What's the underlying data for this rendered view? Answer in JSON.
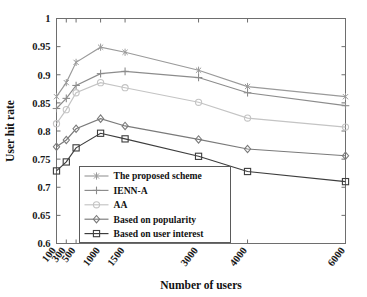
{
  "chart_data": {
    "type": "line",
    "title": "",
    "xlabel": "Number of users",
    "ylabel": "User hit rate",
    "categories": [
      "100",
      "300",
      "500",
      "1000",
      "1500",
      "3000",
      "4000",
      "6000"
    ],
    "x_positions": [
      100,
      300,
      500,
      1000,
      1500,
      3000,
      4000,
      6000
    ],
    "ylim": [
      0.6,
      1
    ],
    "yticks": [
      "0.6",
      "0.65",
      "0.7",
      "0.75",
      "0.8",
      "0.85",
      "0.9",
      "0.95",
      "1"
    ],
    "ytick_values": [
      0.6,
      0.65,
      0.7,
      0.75,
      0.8,
      0.85,
      0.9,
      0.95,
      1
    ],
    "grid": false,
    "legend_position": "lower-left-inside",
    "series": [
      {
        "name": "The proposed scheme",
        "marker": "asterisk",
        "color": "#9a9a9a",
        "values": [
          0.861,
          0.886,
          0.922,
          0.949,
          0.94,
          0.908,
          0.879,
          0.861
        ]
      },
      {
        "name": "IENN-A",
        "marker": "plus",
        "color": "#8c8c8c",
        "values": [
          0.84,
          0.858,
          0.881,
          0.902,
          0.906,
          0.895,
          0.868,
          0.845
        ]
      },
      {
        "name": "AA",
        "marker": "circle",
        "color": "#c4c4c4",
        "values": [
          0.813,
          0.838,
          0.868,
          0.886,
          0.877,
          0.851,
          0.823,
          0.807
        ]
      },
      {
        "name": "Based on popularity",
        "marker": "diamond",
        "color": "#7a7a7a",
        "values": [
          0.772,
          0.784,
          0.804,
          0.822,
          0.809,
          0.785,
          0.768,
          0.756
        ]
      },
      {
        "name": "Based on user interest",
        "marker": "square",
        "color": "#3d3d3d",
        "values": [
          0.729,
          0.745,
          0.77,
          0.796,
          0.786,
          0.755,
          0.728,
          0.71
        ]
      }
    ]
  },
  "axes": {
    "y_label": "User hit rate",
    "x_label": "Number of users",
    "y_ticks": [
      "1",
      "0.95",
      "0.9",
      "0.85",
      "0.8",
      "0.75",
      "0.7",
      "0.65",
      "0.6"
    ],
    "x_ticks": [
      "100",
      "300",
      "500",
      "1000",
      "1500",
      "3000",
      "4000",
      "6000"
    ]
  },
  "legend": {
    "items": [
      {
        "label": "The proposed scheme",
        "marker": "asterisk-marker",
        "color": "#9a9a9a"
      },
      {
        "label": "IENN-A",
        "marker": "plus-marker",
        "color": "#8c8c8c"
      },
      {
        "label": "AA",
        "marker": "circle-marker",
        "color": "#c4c4c4"
      },
      {
        "label": "Based on popularity",
        "marker": "diamond-marker",
        "color": "#7a7a7a"
      },
      {
        "label": "Based on user interest",
        "marker": "square-marker",
        "color": "#3d3d3d"
      }
    ]
  }
}
